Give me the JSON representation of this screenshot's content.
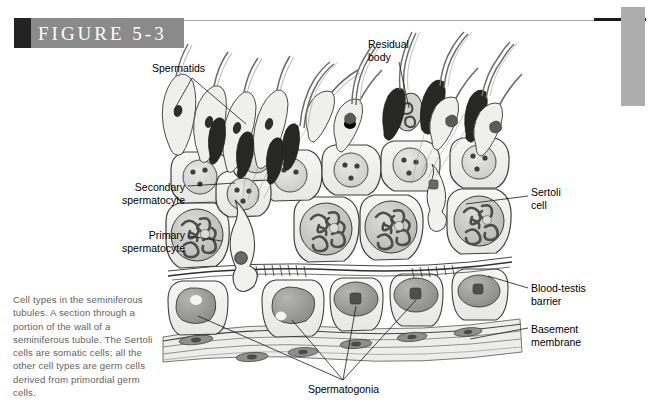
{
  "figure": {
    "banner_label": "FIGURE 5-3",
    "caption": "Cell types in the seminiferous tubules. A section through a portion of the wall of a seminiferous tubule. The Sertoli cells are somatic cells; all the other cell types are germ cells derived from primordial germ cells."
  },
  "labels": {
    "spermatids": "Spermatids",
    "residual_body": "Residual\nbody",
    "secondary_spermatocyte": "Secondary\nspermatocyte",
    "primary_spermatocyte": "Primary\nspermatocyte",
    "sertoli_cell": "Sertoli\ncell",
    "blood_testis_barrier": "Blood-testis\nbarrier",
    "basement_membrane": "Basement\nmembrane",
    "spermatogonia": "Spermatogonia"
  },
  "colors": {
    "banner_gray": "#8a8a8a",
    "banner_dark": "#232323",
    "side_bar_gray": "#adadad",
    "rule_line": "#a9a9a9",
    "rule_thick": "#1a1a1a",
    "caption_text": "#5f5f5f",
    "label_text": "#000000",
    "page_background": "#ffffff",
    "cell_cytoplasm": "#f0f0ee",
    "cell_outline": "#4a4a4a",
    "nucleus_light": "#d6d6d4",
    "nucleus_mid": "#b4b4b2",
    "chromatin_dark": "#5a5a5a",
    "sperm_head_dark": "#2b2b2b",
    "spermatogonium_fill": "#9a9a98",
    "basement_fill": "#e2e2e0"
  }
}
